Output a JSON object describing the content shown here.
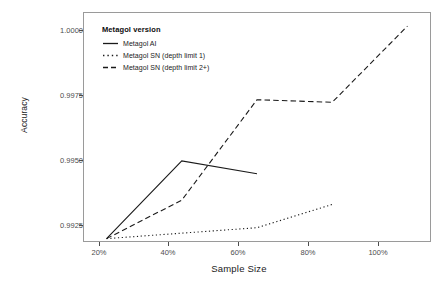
{
  "chart_data": {
    "type": "line",
    "title": "",
    "xlabel": "Sample Size",
    "ylabel": "Accuracy",
    "x": [
      20,
      40,
      60,
      80,
      100
    ],
    "xtick_labels": [
      "20%",
      "40%",
      "60%",
      "80%",
      "100%"
    ],
    "ytick_labels": [
      "0.9925",
      "0.9950",
      "0.9975",
      "1.0000"
    ],
    "ytick_values": [
      0.9925,
      0.995,
      0.9975,
      1.0
    ],
    "xlim": [
      14,
      106
    ],
    "ylim": [
      0.99095,
      1.00055
    ],
    "grid": false,
    "legend_position": "top-left-inside",
    "legend_title": "Metagol version",
    "series": [
      {
        "name": "Metagol AI",
        "linetype": "solid",
        "x": [
          20,
          40,
          60
        ],
        "values": [
          0.99105,
          0.99432,
          0.99378
        ]
      },
      {
        "name": "Metagol SN (depth limit 1)",
        "linetype": "dotted",
        "x": [
          20,
          40,
          60,
          80
        ],
        "values": [
          0.99105,
          0.99128,
          0.99151,
          0.99249
        ]
      },
      {
        "name": "Metagol SN (depth limit 2+)",
        "linetype": "dashed",
        "x": [
          20,
          40,
          60,
          80,
          100
        ],
        "values": [
          0.99105,
          0.99267,
          0.9969,
          0.99679,
          1.0
        ]
      }
    ]
  },
  "axes": {
    "y_title": "Accuracy",
    "x_title": "Sample Size",
    "y_ticks": [
      {
        "label": "1.0000",
        "value": 1.0
      },
      {
        "label": "0.9975",
        "value": 0.9975
      },
      {
        "label": "0.9950",
        "value": 0.995
      },
      {
        "label": "0.9925",
        "value": 0.9925
      }
    ],
    "x_ticks": [
      {
        "label": "20%",
        "value": 20
      },
      {
        "label": "40%",
        "value": 40
      },
      {
        "label": "60%",
        "value": 60
      },
      {
        "label": "80%",
        "value": 80
      },
      {
        "label": "100%",
        "value": 100
      }
    ]
  },
  "legend": {
    "title": "Metagol version",
    "items": [
      {
        "label": "Metagol AI",
        "style": "solid"
      },
      {
        "label": "Metagol SN (depth limit 1)",
        "style": "dotted"
      },
      {
        "label": "Metagol SN (depth limit 2+)",
        "style": "dashed"
      }
    ]
  },
  "colors": {
    "line": "#1a1a1a",
    "panel_border": "#9a9a9a",
    "tick_text": "#4d4d4d",
    "background": "#ffffff"
  }
}
